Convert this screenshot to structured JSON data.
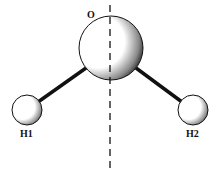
{
  "diagram": {
    "atoms": [
      {
        "id": "O",
        "label": "O",
        "cx": 111,
        "cy": 48,
        "r": 32
      },
      {
        "id": "H1",
        "label": "H1",
        "cx": 27,
        "cy": 110,
        "r": 15
      },
      {
        "id": "H2",
        "label": "H2",
        "cx": 193,
        "cy": 110,
        "r": 15
      }
    ],
    "bonds": [
      {
        "from": "O",
        "to": "H1"
      },
      {
        "from": "O",
        "to": "H2"
      }
    ],
    "symmetry_axis": "dashed vertical line",
    "colors": {
      "stroke": "#111111",
      "fill": "#ffffff",
      "shade": "#222222"
    }
  }
}
